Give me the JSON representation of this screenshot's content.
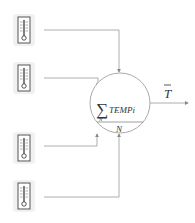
{
  "diagram": {
    "sensors": [
      {
        "id": "sensor-1",
        "icon": "thermometer-icon"
      },
      {
        "id": "sensor-2",
        "icon": "thermometer-icon"
      },
      {
        "id": "sensor-3",
        "icon": "thermometer-icon"
      },
      {
        "id": "sensor-4",
        "icon": "thermometer-icon"
      }
    ],
    "node": {
      "sum_symbol": "∑",
      "numerator": "TEMPi",
      "sum_subscript": "N",
      "denominator": "N"
    },
    "output": {
      "label": "T",
      "overline": true
    },
    "colors": {
      "line": "#999999",
      "circle": "#aaaaaa",
      "text": "#333333"
    }
  }
}
